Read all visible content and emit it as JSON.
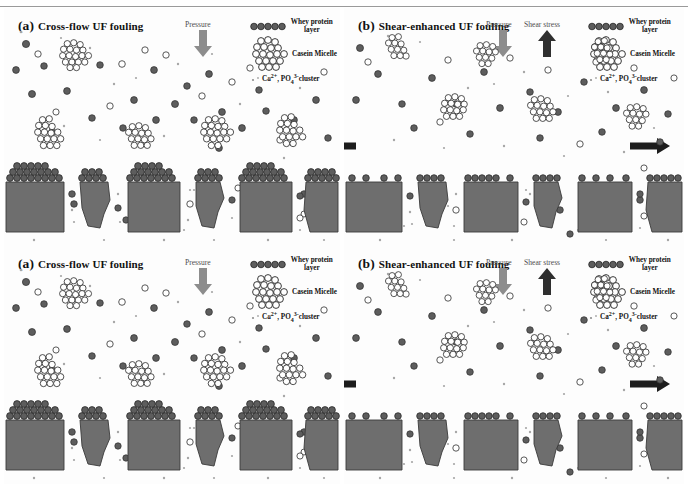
{
  "document": {
    "kind": "scientific-figure",
    "description": "Schematic comparison of cross-flow and shear-enhanced ultrafiltration membrane fouling",
    "repeats": 2
  },
  "colors": {
    "membrane": "#6e6e6e",
    "membrane_edge": "#3c3c3c",
    "whey_particle": "#5d5d5d",
    "whey_particle_edge": "#2e2e2e",
    "casein_circle_edge": "#2e2e2e",
    "casein_circle_fill": "#ffffff",
    "mineral_cluster": "#9a9a9a",
    "pressure_arrow": "#8d8d8d",
    "shear_arrow": "#303030",
    "crossflow_arrow": "#1d1d1d",
    "text": "#111111",
    "rule": "#9a9a9a",
    "background": "#ffffff"
  },
  "panels": [
    {
      "id": "a",
      "label": "(a)",
      "title": "Cross-flow UF fouling",
      "pressure_label": "Pressure",
      "shear_label": null,
      "has_crossflow_arrows": false,
      "fouling_layer": "thick",
      "notes": "Dense whey protein cake layer with large casein micelle aggregates deposited on membrane surface"
    },
    {
      "id": "b",
      "label": "(b)",
      "title": "Shear-enhanced UF fouling",
      "pressure_label": "Pressure",
      "shear_label": "Shear stress",
      "has_crossflow_arrows": true,
      "fouling_layer": "thin",
      "notes": "Thin monolayer whey protein deposit; casein micelles swept away by shear"
    }
  ],
  "legend": {
    "items": [
      {
        "key": "whey",
        "label": "Whey protein\nlayer",
        "line1": "Whey protein",
        "line2": "layer",
        "symbol": "row-of-filled-circles"
      },
      {
        "key": "casein",
        "label": "Casein Micelle",
        "symbol": "cluster-of-open-circles"
      },
      {
        "key": "mineral",
        "label": "Ca2+, PO43-cluster",
        "label_html": "Ca<sup>2+</sup>, PO<sub>4</sub><sup>3-</sup>cluster",
        "symbol": "small-gray-dots"
      }
    ]
  },
  "arrows": {
    "pressure": {
      "direction": "down",
      "color": "#8d8d8d"
    },
    "shear": {
      "direction": "up",
      "color": "#303030"
    },
    "crossflow_left": {
      "direction": "left",
      "color": "#1d1d1d"
    },
    "crossflow_right": {
      "direction": "right",
      "color": "#1d1d1d"
    }
  }
}
